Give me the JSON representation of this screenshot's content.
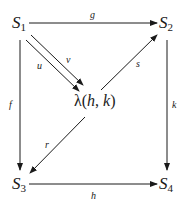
{
  "nodes": {
    "s1": {
      "base": "S",
      "sub": "1"
    },
    "s2": {
      "base": "S",
      "sub": "2"
    },
    "s3": {
      "base": "S",
      "sub": "3"
    },
    "s4": {
      "base": "S",
      "sub": "4"
    },
    "lambda": {
      "symbol": "λ",
      "open": "(",
      "arg1": "h",
      "sep": ", ",
      "arg2": "k",
      "close": ")"
    }
  },
  "arrows": {
    "g": {
      "label": "g",
      "from": "S1",
      "to": "S2"
    },
    "f": {
      "label": "f",
      "from": "S1",
      "to": "S3"
    },
    "k": {
      "label": "k",
      "from": "S2",
      "to": "S4"
    },
    "h": {
      "label": "h",
      "from": "S3",
      "to": "S4"
    },
    "u": {
      "label": "u",
      "from": "S1",
      "to": "λ(h, k)"
    },
    "v": {
      "label": "v",
      "from": "S1",
      "to": "λ(h, k)"
    },
    "s": {
      "label": "s",
      "from": "λ(h, k)",
      "to": "S2"
    },
    "r": {
      "label": "r",
      "from": "λ(h, k)",
      "to": "S3"
    }
  },
  "colors": {
    "ink": "#1a1a1a",
    "background": "#ffffff"
  }
}
